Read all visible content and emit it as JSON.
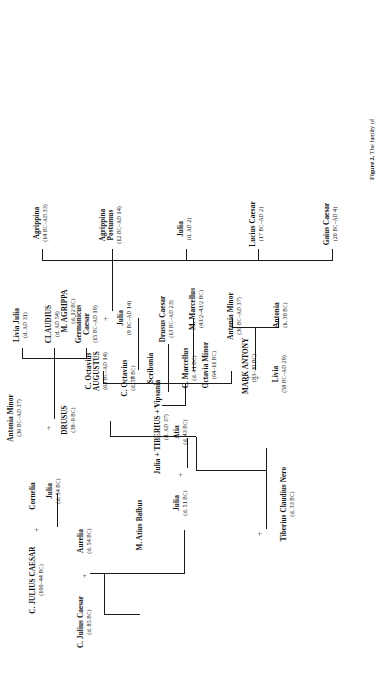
{
  "figure": {
    "caption_label": "Figure 2.",
    "caption_text": "The family of"
  },
  "tree": {
    "title": "Julio-Claudian family tree",
    "generations": [
      {
        "id": "gen-1",
        "people": [
          {
            "id": "c-julius-caesar-elder",
            "name": "C. Julius Caesar",
            "dates": "(d. 85 BC)"
          },
          {
            "id": "aurelia",
            "name": "Aurelia",
            "dates": "(d. 54 BC)"
          },
          {
            "id": "m-atius-balbus",
            "name": "M. Atius Balbus",
            "dates": ""
          }
        ]
      },
      {
        "id": "gen-2",
        "people": [
          {
            "id": "c-julius-caesar",
            "name": "C. JULIUS CAESAR",
            "dates": "(100–44 BC)"
          },
          {
            "id": "cornelia",
            "name": "Cornelia",
            "dates": ""
          },
          {
            "id": "julia-51",
            "name": "Julia",
            "dates": "(d. 51 BC)"
          },
          {
            "id": "atia",
            "name": "Atia",
            "dates": "(d. 43 BC)"
          },
          {
            "id": "c-octavius",
            "name": "C. Octavius",
            "dates": "(d. 58 BC)"
          }
        ]
      },
      {
        "id": "gen-3",
        "people": [
          {
            "id": "julia-54",
            "name": "Julia",
            "dates": "(d. 54 BC)"
          },
          {
            "id": "livia",
            "name": "Livia",
            "dates": "(58 BC–AD 29)"
          },
          {
            "id": "c-octavius-augustus",
            "name": "C. Octavius AUGUSTUS",
            "dates": "(63 BC–AD 14)"
          },
          {
            "id": "scribonia",
            "name": "Scribonia",
            "dates": ""
          },
          {
            "id": "octavia-minor",
            "name": "Octavia Minor",
            "dates": "(64–11 BC)"
          },
          {
            "id": "c-marcellus",
            "name": "C. Marcellus",
            "dates": "(d. 41 BC)"
          },
          {
            "id": "mark-antony",
            "name": "MARK ANTONY",
            "dates": "(83–30 BC)"
          },
          {
            "id": "tiberius-claudius-nero",
            "name": "Tiberius Claudius Nero",
            "dates": "(d. 33 BC)"
          }
        ]
      },
      {
        "id": "gen-4",
        "people": [
          {
            "id": "drusus",
            "name": "DRUSUS",
            "dates": "(38–9 BC)"
          },
          {
            "id": "antonia-minor-spouse",
            "name": "Antonia Minor",
            "dates": "(36 BC–AD 37)"
          },
          {
            "id": "julia-tiberius-vipsania",
            "name": "Julia + TIBERIUS + Vipsania",
            "dates": "(d. AD 37)"
          },
          {
            "id": "julia-9bc",
            "name": "Julia",
            "dates": "(9 BC–AD 14)"
          },
          {
            "id": "m-agrippa",
            "name": "M. AGRIPPA",
            "dates": "(d. 12 BC)"
          },
          {
            "id": "m-marcellus",
            "name": "M. Marcellus",
            "dates": "(43/2–43/2 BC)"
          },
          {
            "id": "antonia-minor",
            "name": "Antonia Minor",
            "dates": "(36 BC–AD 37)"
          },
          {
            "id": "antonia",
            "name": "Antonia",
            "dates": "(b. 39 BC)"
          }
        ]
      },
      {
        "id": "gen-5",
        "people": [
          {
            "id": "livia-julia",
            "name": "Livia Julia",
            "dates": "(d. AD 31)"
          },
          {
            "id": "claudius",
            "name": "CLAUDIUS",
            "dates": "(d. AD 54)"
          },
          {
            "id": "germanicus-caesar",
            "name": "Germanicus Caesar",
            "dates": "(15 BC–AD 19)"
          },
          {
            "id": "drusus-caesar",
            "name": "Drusus Caesar",
            "dates": "(13 BC–AD 23)"
          },
          {
            "id": "agrippina",
            "name": "Agrippina",
            "dates": "(14 BC–AD 33)"
          },
          {
            "id": "agrippina-postumus",
            "name": "Agrippina Postumus",
            "dates": "(12 BC–AD 14)"
          },
          {
            "id": "julia-ad2",
            "name": "Julia",
            "dates": "(d. AD 2)"
          },
          {
            "id": "lucius-caesar",
            "name": "Lucius Caesar",
            "dates": "(17 BC–AD 2)"
          },
          {
            "id": "gaius-caesar",
            "name": "Gaius Caesar",
            "dates": "(20 BC–AD 4)"
          }
        ]
      }
    ],
    "marriage_symbol": "+"
  }
}
